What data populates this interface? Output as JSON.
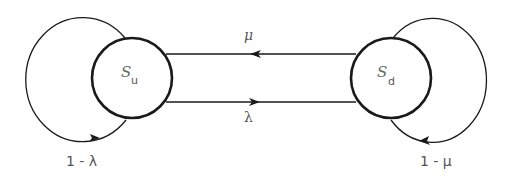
{
  "diagram": {
    "type": "state-transition",
    "colors": {
      "stroke": "#1a1a1a",
      "text": "#555555",
      "background": "#ffffff"
    },
    "states": [
      {
        "id": "su",
        "symbol": "S",
        "subscript": "u"
      },
      {
        "id": "sd",
        "symbol": "S",
        "subscript": "d"
      }
    ],
    "transitions": [
      {
        "from": "sd",
        "to": "su",
        "label": "μ"
      },
      {
        "from": "su",
        "to": "sd",
        "label": "λ"
      },
      {
        "from": "su",
        "to": "su",
        "label": "1 - λ"
      },
      {
        "from": "sd",
        "to": "sd",
        "label": "1 - μ"
      }
    ]
  }
}
